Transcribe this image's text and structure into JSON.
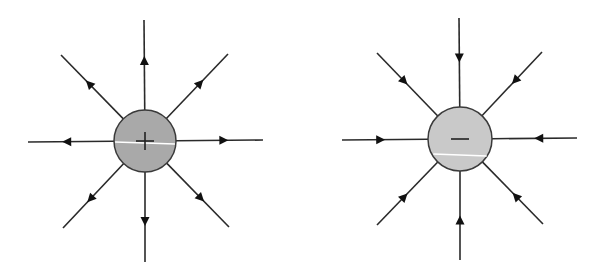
{
  "title": "Electric field lines of point charges",
  "colors": {
    "background": "#ffffff",
    "line": "#2a2a2a",
    "arrow": "#111111",
    "outline": "#3a3a3a",
    "glint": "#ffffff"
  },
  "charges": [
    {
      "id": "positive",
      "label": "Positive charge",
      "sign": "+",
      "direction": "outward",
      "center": [
        145,
        141
      ],
      "radius": 31,
      "fill": "#a9a9a9",
      "glint_y": 143,
      "lines": [
        {
          "angle": "up",
          "end": [
            144,
            20
          ]
        },
        {
          "angle": "up-right",
          "end": [
            228,
            54
          ]
        },
        {
          "angle": "right",
          "end": [
            263,
            140
          ]
        },
        {
          "angle": "down-right",
          "end": [
            229,
            227
          ]
        },
        {
          "angle": "down",
          "end": [
            145,
            262
          ]
        },
        {
          "angle": "down-left",
          "end": [
            63,
            228
          ]
        },
        {
          "angle": "left",
          "end": [
            28,
            142
          ]
        },
        {
          "angle": "up-left",
          "end": [
            61,
            55
          ]
        }
      ]
    },
    {
      "id": "negative",
      "label": "Negative charge",
      "sign": "−",
      "direction": "inward",
      "center": [
        460,
        139
      ],
      "radius": 32,
      "fill": "#c9c9c9",
      "glint_y": 155,
      "lines": [
        {
          "angle": "up",
          "end": [
            459,
            18
          ]
        },
        {
          "angle": "up-right",
          "end": [
            542,
            52
          ]
        },
        {
          "angle": "right",
          "end": [
            577,
            138
          ]
        },
        {
          "angle": "down-right",
          "end": [
            543,
            224
          ]
        },
        {
          "angle": "down",
          "end": [
            460,
            260
          ]
        },
        {
          "angle": "down-left",
          "end": [
            377,
            225
          ]
        },
        {
          "angle": "left",
          "end": [
            342,
            140
          ]
        },
        {
          "angle": "up-left",
          "end": [
            377,
            53
          ]
        }
      ]
    }
  ]
}
